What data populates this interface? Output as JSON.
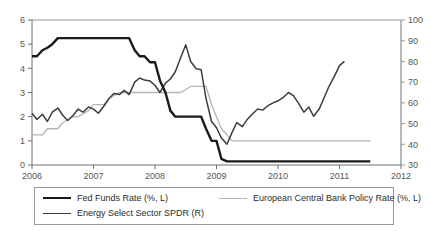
{
  "chart_data": {
    "type": "line",
    "title": "",
    "subtitle": "",
    "xlabel": "",
    "ylabel": "",
    "y2label": "",
    "grid": false,
    "legend_position": "bottom",
    "xlim": [
      2006.0,
      2012.0
    ],
    "ylim_left": [
      0,
      6
    ],
    "ylim_right": [
      30,
      100
    ],
    "x_ticks": [
      "2006",
      "2007",
      "2008",
      "2009",
      "2010",
      "2011",
      "2012"
    ],
    "y_ticks_left": [
      "0",
      "1",
      "2",
      "3",
      "4",
      "5",
      "6"
    ],
    "y_ticks_right": [
      "30",
      "40",
      "50",
      "60",
      "70",
      "80",
      "90",
      "100"
    ],
    "series": [
      {
        "name": "Fed Funds Rate (%, L)",
        "axis": "left",
        "color": "#1a1a1a",
        "width": 2.4,
        "x": [
          2006.0,
          2006.08,
          2006.17,
          2006.25,
          2006.33,
          2006.42,
          2006.5,
          2006.58,
          2006.67,
          2006.75,
          2006.83,
          2006.92,
          2007.0,
          2007.17,
          2007.33,
          2007.5,
          2007.58,
          2007.67,
          2007.75,
          2007.83,
          2007.92,
          2008.0,
          2008.08,
          2008.17,
          2008.25,
          2008.33,
          2008.5,
          2008.67,
          2008.75,
          2008.83,
          2008.92,
          2009.0,
          2009.08,
          2009.17,
          2009.33,
          2009.5,
          2010.0,
          2010.5,
          2011.0,
          2011.5
        ],
        "y": [
          4.5,
          4.5,
          4.75,
          4.85,
          5.0,
          5.25,
          5.25,
          5.25,
          5.25,
          5.25,
          5.25,
          5.25,
          5.25,
          5.25,
          5.25,
          5.25,
          5.25,
          4.75,
          4.5,
          4.5,
          4.25,
          4.25,
          3.5,
          3.0,
          2.25,
          2.0,
          2.0,
          2.0,
          2.0,
          1.5,
          1.0,
          1.0,
          0.25,
          0.15,
          0.15,
          0.15,
          0.15,
          0.15,
          0.15,
          0.15
        ]
      },
      {
        "name": "European Central Bank Policy Rate (%, L)",
        "axis": "left",
        "color": "#b4b4b4",
        "width": 1.3,
        "x": [
          2006.0,
          2006.17,
          2006.25,
          2006.42,
          2006.5,
          2006.67,
          2006.75,
          2006.92,
          2007.0,
          2007.17,
          2007.25,
          2007.42,
          2007.5,
          2007.58,
          2007.67,
          2008.0,
          2008.42,
          2008.58,
          2008.67,
          2008.75,
          2008.83,
          2008.92,
          2009.0,
          2009.08,
          2009.17,
          2009.25,
          2009.33,
          2009.42,
          2009.5,
          2010.0,
          2010.5,
          2011.0,
          2011.17,
          2011.5
        ],
        "y": [
          1.25,
          1.25,
          1.5,
          1.5,
          1.75,
          2.0,
          2.0,
          2.25,
          2.5,
          2.5,
          2.75,
          3.0,
          3.0,
          3.0,
          3.0,
          3.0,
          3.0,
          3.25,
          3.25,
          3.25,
          3.25,
          2.5,
          2.0,
          1.5,
          1.25,
          1.0,
          1.0,
          1.0,
          1.0,
          1.0,
          1.0,
          1.0,
          1.0,
          1.0
        ]
      },
      {
        "name": "Energy Select Sector SPDR (R)",
        "axis": "right",
        "color": "#3d3d3d",
        "width": 1.5,
        "x": [
          2006.0,
          2006.08,
          2006.17,
          2006.25,
          2006.33,
          2006.42,
          2006.5,
          2006.58,
          2006.67,
          2006.75,
          2006.83,
          2006.92,
          2007.0,
          2007.08,
          2007.17,
          2007.25,
          2007.33,
          2007.42,
          2007.5,
          2007.58,
          2007.67,
          2007.75,
          2007.83,
          2007.92,
          2008.0,
          2008.08,
          2008.17,
          2008.25,
          2008.33,
          2008.42,
          2008.5,
          2008.58,
          2008.67,
          2008.75,
          2008.83,
          2008.92,
          2009.0,
          2009.08,
          2009.17,
          2009.25,
          2009.33,
          2009.42,
          2009.5,
          2009.58,
          2009.67,
          2009.75,
          2009.83,
          2009.92,
          2010.0,
          2010.08,
          2010.17,
          2010.25,
          2010.33,
          2010.42,
          2010.5,
          2010.58,
          2010.67,
          2010.75,
          2010.83,
          2010.92,
          2011.0,
          2011.08
        ],
        "y": [
          55.0,
          52.0,
          54.5,
          51.0,
          55.5,
          57.5,
          54.0,
          51.5,
          54.0,
          57.0,
          55.5,
          58.0,
          57.0,
          55.0,
          58.5,
          62.0,
          64.5,
          64.0,
          66.0,
          64.0,
          70.0,
          72.0,
          71.0,
          70.5,
          68.5,
          65.0,
          69.5,
          71.5,
          75.0,
          82.0,
          88.0,
          80.0,
          76.5,
          76.0,
          62.0,
          51.0,
          48.0,
          43.0,
          40.0,
          45.5,
          50.5,
          48.5,
          52.0,
          54.5,
          57.0,
          56.5,
          58.5,
          60.0,
          61.0,
          62.5,
          65.0,
          63.5,
          60.0,
          55.5,
          58.0,
          53.5,
          57.0,
          62.5,
          68.0,
          73.0,
          78.0,
          80.0
        ]
      }
    ]
  },
  "legend": {
    "items": [
      {
        "label": "Fed Funds Rate (%, L)"
      },
      {
        "label": "Energy Select Sector SPDR (R)"
      },
      {
        "label": "European Central Bank Policy Rate (%, L)"
      }
    ]
  }
}
